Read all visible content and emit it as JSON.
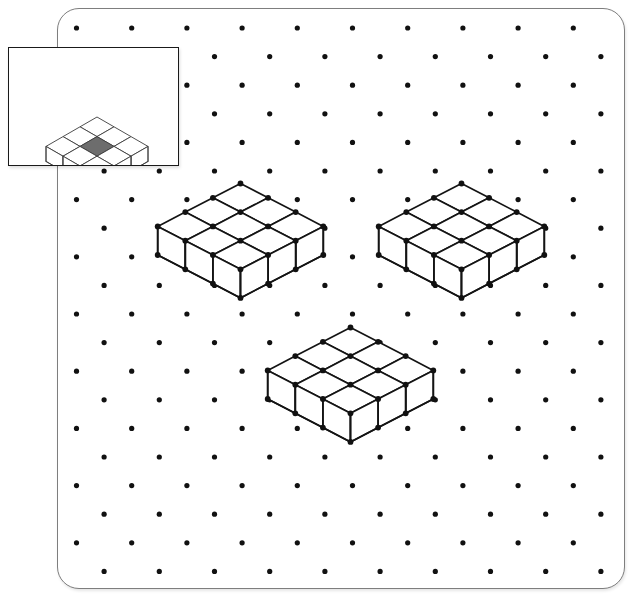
{
  "page": {
    "background_color": "#ffffff",
    "card": {
      "border_color": "#7e7e7e",
      "fill_color": "#ffffff",
      "corner_radius": 22,
      "x": 57,
      "y": 8,
      "width": 566,
      "height": 579
    }
  },
  "copyright": {
    "text": "© Cuisenaire Company of America, Inc.",
    "color": "#8a8a8a",
    "orientation": "vertical-rotated-90-ccw"
  },
  "dot_grid": {
    "name": "isometric-dot-grid",
    "dot_color": "#111111",
    "dot_radius": 2.6,
    "column_spacing": 55.2,
    "row_spacing": 28.6,
    "row_offset": 27.6,
    "origin_x": 75.5,
    "origin_y": 27.0,
    "columns": 11,
    "rows": 21
  },
  "inset": {
    "name": "example-inset-box",
    "border_color": "#1a1a1a",
    "fill_color": "#ffffff",
    "x": 8,
    "y": 47,
    "width": 169,
    "height": 117,
    "figure": {
      "name": "example-cube-building",
      "description": "3 by 3 single layer of cubes with the centre top face shaded",
      "rows": 3,
      "cols": 3,
      "layers": 1,
      "shaded_cell": [
        1,
        1
      ],
      "shaded_color": "#6d6d6d",
      "line_color": "#3c3c3c",
      "face_color": "#ffffff",
      "cell_width": 17.0,
      "cell_height": 9.8,
      "cube_height": 15.0,
      "apex_x": 88,
      "apex_y": 69
    }
  },
  "figures": [
    {
      "name": "cube-building-left",
      "description": "3 by 3 single layer of cubes drawn on isometric dots",
      "rows": 3,
      "cols": 3,
      "layers": 1,
      "line_color": "#141414",
      "face_color": "#ffffff",
      "vertex_dot_color": "#111111",
      "vertex_dot_radius": 2.9,
      "apex_x": 240.5,
      "apex_y": 183.5,
      "cell_width": 27.6,
      "cell_height": 14.3,
      "cube_height": 28.6
    },
    {
      "name": "cube-building-right",
      "description": "3 by 3 single layer of cubes drawn on isometric dots",
      "rows": 3,
      "cols": 3,
      "layers": 1,
      "line_color": "#141414",
      "face_color": "#ffffff",
      "vertex_dot_color": "#111111",
      "vertex_dot_radius": 2.9,
      "apex_x": 461.5,
      "apex_y": 183.5,
      "cell_width": 27.6,
      "cell_height": 14.3,
      "cube_height": 28.6
    },
    {
      "name": "cube-building-bottom",
      "description": "3 by 3 single layer of cubes drawn on isometric dots",
      "rows": 3,
      "cols": 3,
      "layers": 1,
      "line_color": "#141414",
      "face_color": "#ffffff",
      "vertex_dot_color": "#111111",
      "vertex_dot_radius": 2.9,
      "apex_x": 350.5,
      "apex_y": 327.5,
      "cell_width": 27.6,
      "cell_height": 14.3,
      "cube_height": 28.6
    }
  ]
}
